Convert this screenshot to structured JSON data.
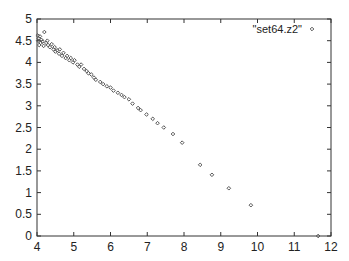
{
  "chart_data": {
    "type": "scatter",
    "title": "",
    "xlabel": "",
    "ylabel": "",
    "xlim": [
      4,
      12
    ],
    "ylim": [
      0,
      5
    ],
    "grid": false,
    "legend_position": "top-right",
    "x_ticks": [
      "4",
      "5",
      "6",
      "7",
      "8",
      "9",
      "10",
      "11",
      "12"
    ],
    "y_ticks": [
      "0",
      "0.5",
      "1",
      "1.5",
      "2",
      "2.5",
      "3",
      "3.5",
      "4",
      "4.5",
      "5"
    ],
    "series": [
      {
        "name": "\"set64.z2\"",
        "marker": "diamond",
        "color": "#555555",
        "points": [
          [
            4.02,
            4.62
          ],
          [
            4.05,
            4.55
          ],
          [
            4.03,
            4.5
          ],
          [
            4.08,
            4.6
          ],
          [
            4.1,
            4.45
          ],
          [
            4.06,
            4.4
          ],
          [
            4.12,
            4.52
          ],
          [
            4.15,
            4.48
          ],
          [
            4.2,
            4.7
          ],
          [
            4.18,
            4.38
          ],
          [
            4.25,
            4.45
          ],
          [
            4.3,
            4.4
          ],
          [
            4.28,
            4.5
          ],
          [
            4.35,
            4.35
          ],
          [
            4.4,
            4.42
          ],
          [
            4.45,
            4.3
          ],
          [
            4.5,
            4.25
          ],
          [
            4.48,
            4.35
          ],
          [
            4.55,
            4.28
          ],
          [
            4.6,
            4.2
          ],
          [
            4.62,
            4.3
          ],
          [
            4.68,
            4.15
          ],
          [
            4.72,
            4.22
          ],
          [
            4.78,
            4.1
          ],
          [
            4.82,
            4.15
          ],
          [
            4.88,
            4.05
          ],
          [
            4.92,
            4.1
          ],
          [
            4.98,
            4.0
          ],
          [
            5.02,
            4.05
          ],
          [
            5.1,
            3.95
          ],
          [
            5.15,
            3.9
          ],
          [
            5.2,
            3.95
          ],
          [
            5.28,
            3.85
          ],
          [
            5.35,
            3.8
          ],
          [
            5.4,
            3.75
          ],
          [
            5.48,
            3.72
          ],
          [
            5.55,
            3.65
          ],
          [
            5.6,
            3.6
          ],
          [
            5.72,
            3.55
          ],
          [
            5.8,
            3.5
          ],
          [
            5.9,
            3.45
          ],
          [
            6.0,
            3.42
          ],
          [
            6.08,
            3.35
          ],
          [
            6.2,
            3.3
          ],
          [
            6.3,
            3.25
          ],
          [
            6.38,
            3.2
          ],
          [
            6.5,
            3.15
          ],
          [
            6.6,
            3.05
          ],
          [
            6.75,
            2.95
          ],
          [
            6.82,
            2.9
          ],
          [
            6.98,
            2.8
          ],
          [
            7.15,
            2.7
          ],
          [
            7.28,
            2.6
          ],
          [
            7.45,
            2.5
          ],
          [
            7.7,
            2.35
          ],
          [
            7.95,
            2.15
          ],
          [
            8.44,
            1.64
          ],
          [
            8.76,
            1.41
          ],
          [
            9.22,
            1.1
          ],
          [
            9.82,
            0.71
          ],
          [
            11.65,
            0.0
          ]
        ]
      }
    ]
  }
}
